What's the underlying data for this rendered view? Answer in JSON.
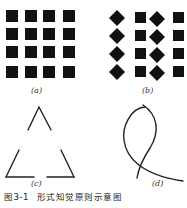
{
  "figure": {
    "number": "图3-1",
    "title": "形式知觉原则示意图",
    "panels": [
      {
        "id": "a",
        "label": "(a)",
        "description": "4x4 grid of black squares"
      },
      {
        "id": "b",
        "label": "(b)",
        "description": "4 rows alternating diamond, square, diamond, square"
      },
      {
        "id": "c",
        "label": "(c)",
        "description": "triangle outline with gaps at the midpoints of each side"
      },
      {
        "id": "d",
        "label": "(d)",
        "description": "two crossing curved lines"
      }
    ]
  },
  "colors": {
    "ink": "#111111",
    "background": "#ffffff"
  }
}
